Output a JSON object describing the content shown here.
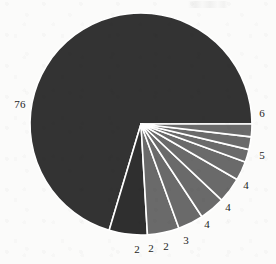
{
  "chart_data": {
    "type": "pie",
    "title": "",
    "subtitle": "",
    "xlabel": "",
    "ylabel": "",
    "legend_position": "none",
    "grid": false,
    "labels_shown_as": "value",
    "total": 104,
    "start_angle_deg": 0,
    "direction": "counterclockwise",
    "categories": [
      "76",
      "6",
      "5",
      "4",
      "4",
      "3",
      "2",
      "2",
      "2"
    ],
    "values": [
      76,
      6,
      5,
      4,
      4,
      3,
      2,
      2,
      2
    ],
    "slices": [
      {
        "label": "76",
        "value": 76,
        "color": "#333333",
        "label_x": 20,
        "label_y": 104
      },
      {
        "label": "6",
        "value": 6,
        "color": "#2f2f2f",
        "label_x": 262,
        "label_y": 113
      },
      {
        "label": "5",
        "value": 5,
        "color": "#6a6a6a",
        "label_x": 262,
        "label_y": 155
      },
      {
        "label": "4",
        "value": 4,
        "color": "#6a6a6a",
        "label_x": 246,
        "label_y": 185
      },
      {
        "label": "4",
        "value": 4,
        "color": "#6a6a6a",
        "label_x": 228,
        "label_y": 207
      },
      {
        "label": "4",
        "value": 4,
        "color": "#6a6a6a",
        "label_x": 207,
        "label_y": 224
      },
      {
        "label": "3",
        "value": 3,
        "color": "#6a6a6a",
        "label_x": 186,
        "label_y": 240
      },
      {
        "label": "2",
        "value": 2,
        "color": "#6a6a6a",
        "label_x": 166,
        "label_y": 246
      },
      {
        "label": "2",
        "value": 2,
        "color": "#6a6a6a",
        "label_x": 151,
        "label_y": 248
      },
      {
        "label": "2",
        "value": 2,
        "color": "#6a6a6a",
        "label_x": 137,
        "label_y": 249
      }
    ],
    "geometry": {
      "center_x": 141,
      "center_y": 124,
      "radius": 111
    },
    "colors": {
      "dark": "#333333",
      "mid_gray": "#6a6a6a",
      "separator": "#ffffff",
      "background": "#fbfbfa",
      "label_text": "#1d1d1d"
    }
  }
}
